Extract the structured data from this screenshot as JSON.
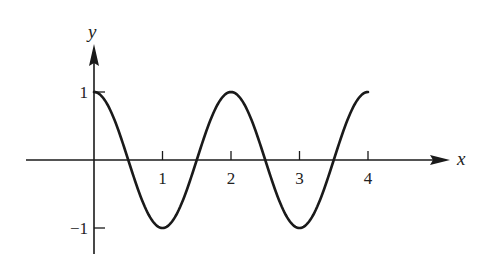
{
  "chart_data": {
    "type": "line",
    "title": "",
    "xlabel": "x",
    "ylabel": "y",
    "function": "y = cos(pi x)",
    "xlim": [
      0,
      4
    ],
    "ylim": [
      -1,
      1
    ],
    "x_ticks": [
      1,
      2,
      3,
      4
    ],
    "x_tick_labels": [
      "1",
      "2",
      "3",
      "4"
    ],
    "y_ticks": [
      1,
      -1
    ],
    "y_tick_labels": [
      "1",
      "−1"
    ],
    "grid": false,
    "legend": null,
    "series": [
      {
        "name": "cos(pi x)",
        "x": [
          0,
          0.25,
          0.5,
          0.75,
          1,
          1.25,
          1.5,
          1.75,
          2,
          2.25,
          2.5,
          2.75,
          3,
          3.25,
          3.5,
          3.75,
          4
        ],
        "y": [
          1,
          0.707,
          0,
          -0.707,
          -1,
          -0.707,
          0,
          0.707,
          1,
          0.707,
          0,
          -0.707,
          -1,
          -0.707,
          0,
          0.707,
          1
        ]
      }
    ]
  },
  "layout": {
    "origin_px": [
      94,
      160
    ],
    "unit_px_x": 68.5,
    "unit_px_y": 68,
    "x_axis_end_px": 450,
    "y_axis_top_px": 44,
    "y_axis_bottom_px": 254,
    "line_color": "#1a1a1a"
  }
}
